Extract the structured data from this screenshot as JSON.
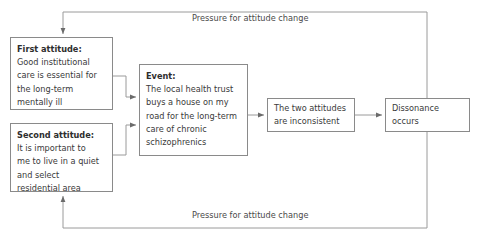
{
  "diagram": {
    "line_color": "#8a8a8a",
    "text_color": "#3a3a3a",
    "background": "#ffffff",
    "nodes": {
      "first_attitude": {
        "heading": "First attitude:",
        "lines": [
          "Good institutional",
          "care is essential for",
          "the long-term",
          "mentally ill"
        ]
      },
      "second_attitude": {
        "heading": "Second attitude:",
        "lines": [
          "It is important to",
          "me to live in a quiet",
          "and select",
          "residential area"
        ]
      },
      "event": {
        "heading": "Event:",
        "lines": [
          "The local health trust",
          "buys a house on my",
          "road for the long-term",
          "care of chronic",
          "schizophrenics"
        ]
      },
      "inconsistent": {
        "lines": [
          "The two attitudes",
          "are inconsistent"
        ]
      },
      "dissonance": {
        "lines": [
          "Dissonance",
          "occurs"
        ]
      }
    },
    "labels": {
      "top_loop": "Pressure for attitude change",
      "bottom_loop": "Pressure for attitude change"
    }
  }
}
